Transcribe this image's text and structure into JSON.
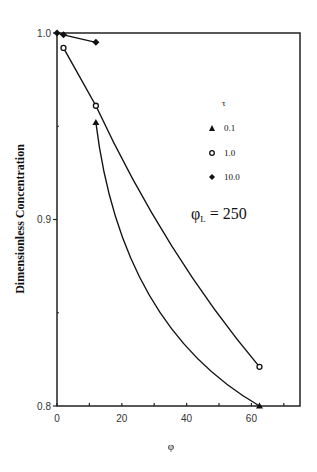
{
  "chart_data": {
    "type": "line",
    "title": "",
    "xlabel": "φ",
    "ylabel": "Dimensionless  Concentration",
    "xlim": [
      0,
      75
    ],
    "ylim": [
      0.8,
      1.0
    ],
    "xticks": [
      "0",
      "20",
      "40",
      "60"
    ],
    "yticks": [
      "0.8",
      "0.9",
      "1.0"
    ],
    "legend_title": "τ",
    "annotation": "φL = 250",
    "annotation_main": "φ",
    "annotation_sub": "L",
    "annotation_rest": " = 250",
    "grid": false,
    "series": [
      {
        "name": "0.1",
        "marker": "triangle",
        "x": [
          12,
          62.5
        ],
        "y": [
          0.952,
          0.8
        ]
      },
      {
        "name": "1.0",
        "marker": "open-circle",
        "x": [
          2,
          12,
          62.5
        ],
        "y": [
          0.992,
          0.961,
          0.821
        ]
      },
      {
        "name": "10.0",
        "marker": "diamond",
        "x": [
          0,
          2,
          12
        ],
        "y": [
          1.0,
          0.999,
          0.995
        ]
      }
    ]
  }
}
